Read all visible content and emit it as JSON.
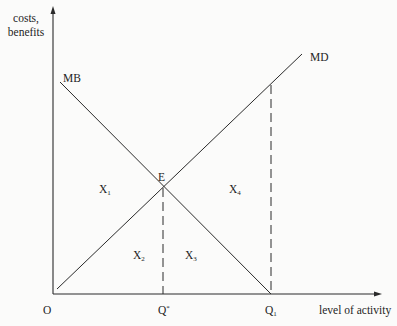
{
  "diagram": {
    "type": "marginal-benefit-marginal-damage",
    "axes": {
      "y_label_line1": "costs,",
      "y_label_line2": "benefits",
      "x_label": "level of activity",
      "origin_label": "O"
    },
    "curves": {
      "mb": {
        "label": "MB",
        "direction": "downward-sloping"
      },
      "md": {
        "label": "MD",
        "direction": "upward-sloping"
      }
    },
    "points": {
      "equilibrium": {
        "label": "E"
      }
    },
    "x_ticks": {
      "q_star": {
        "label": "Q",
        "suffix": "*"
      },
      "q_1": {
        "label": "Q",
        "subscript": "1"
      }
    },
    "areas": {
      "x1": {
        "label": "X",
        "subscript": "1"
      },
      "x2": {
        "label": "X",
        "subscript": "2"
      },
      "x3": {
        "label": "X",
        "subscript": "3"
      },
      "x4": {
        "label": "X",
        "subscript": "4"
      }
    },
    "colors": {
      "line": "#2a2a2a",
      "background": "#fbfbfa"
    }
  }
}
